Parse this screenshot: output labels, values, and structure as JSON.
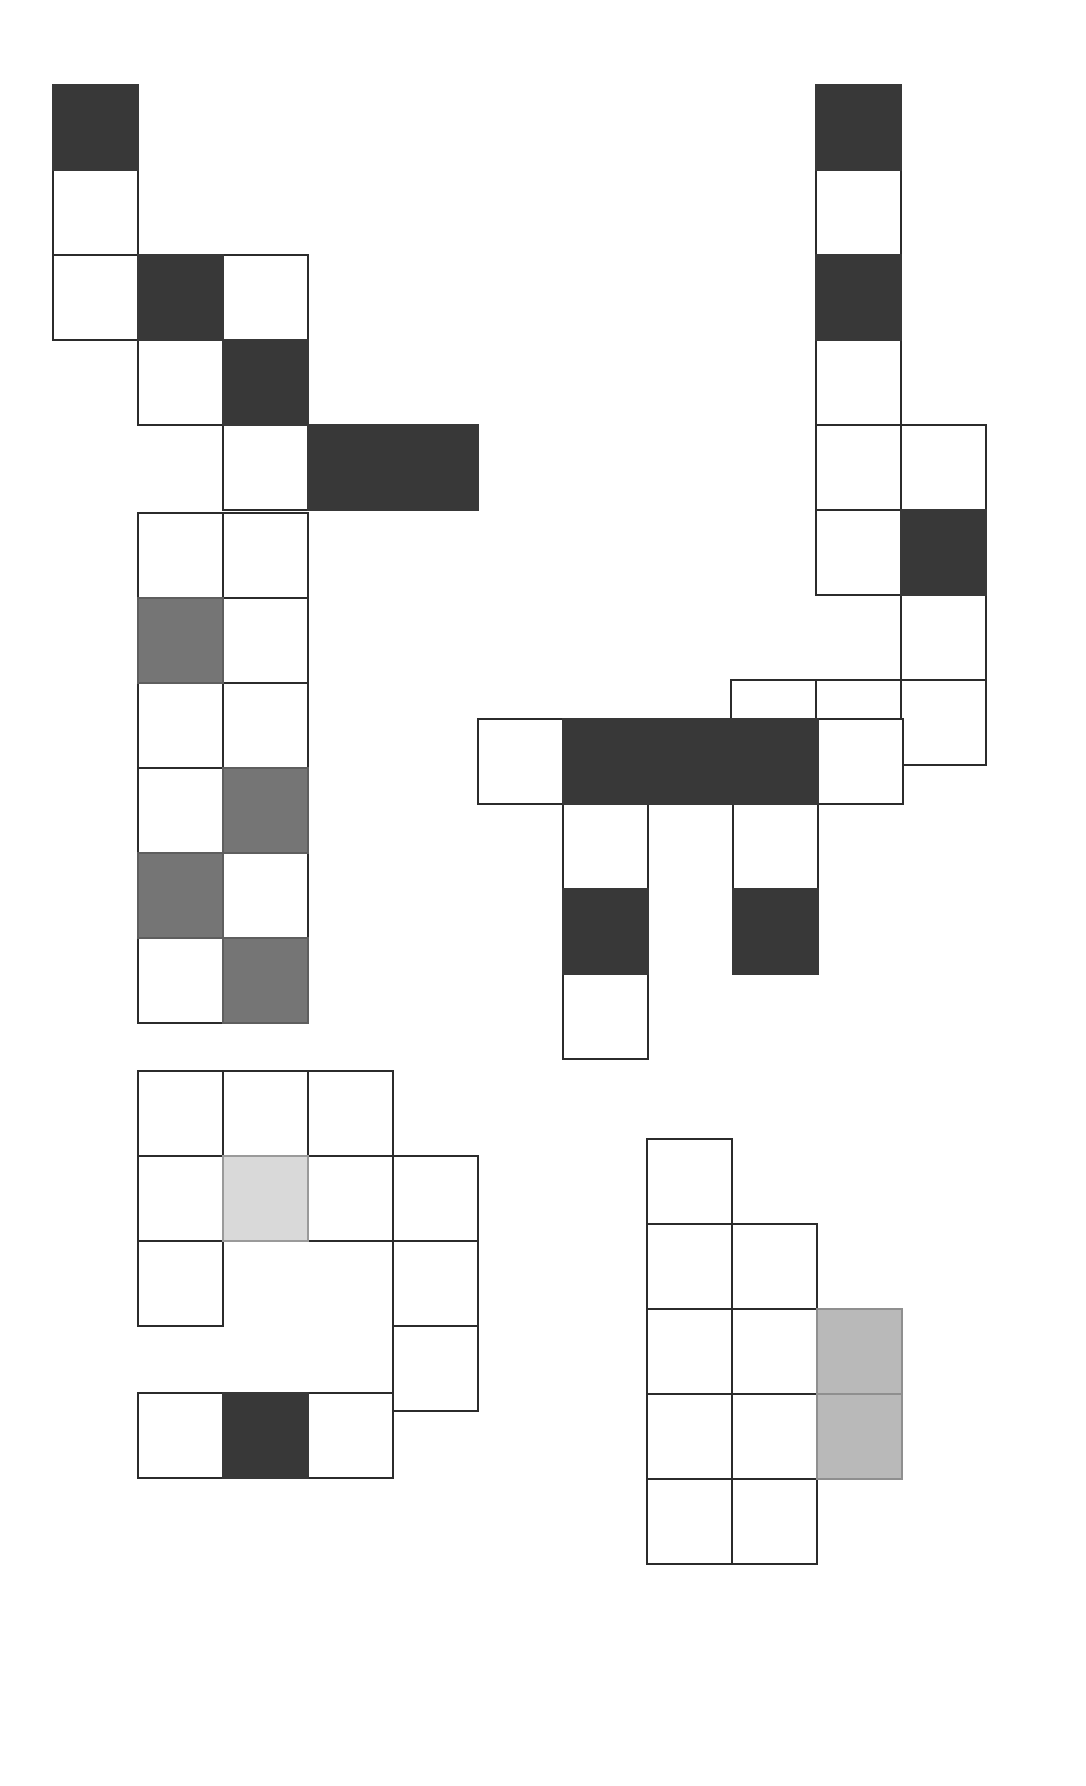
{
  "figure": {
    "background_color": "#ffffff",
    "stroke_color": "#2b2b2b",
    "cell_size": 85,
    "palette": {
      "none": "#ffffff",
      "dark": "#383838",
      "medium": "#757575",
      "light": "#b9b9b9",
      "pale": "#d9d9d9"
    },
    "shapes": [
      {
        "id": "shape-1",
        "name": "descending-staircase",
        "origin_x": 52,
        "origin_y": 84,
        "cell_size": 85,
        "cells": [
          {
            "col": 0,
            "row": 0,
            "fill": "dark"
          },
          {
            "col": 0,
            "row": 1,
            "fill": "none"
          },
          {
            "col": 0,
            "row": 2,
            "fill": "none"
          },
          {
            "col": 1,
            "row": 2,
            "fill": "dark"
          },
          {
            "col": 2,
            "row": 2,
            "fill": "none"
          },
          {
            "col": 1,
            "row": 3,
            "fill": "none"
          },
          {
            "col": 2,
            "row": 3,
            "fill": "dark"
          },
          {
            "col": 2,
            "row": 4,
            "fill": "none"
          },
          {
            "col": 3,
            "row": 4,
            "fill": "dark"
          },
          {
            "col": 4,
            "row": 4,
            "fill": "dark"
          }
        ]
      },
      {
        "id": "shape-2",
        "name": "vertical-column-with-foot",
        "origin_x": 730,
        "origin_y": 84,
        "cell_size": 85,
        "cells": [
          {
            "col": 1,
            "row": 0,
            "fill": "dark"
          },
          {
            "col": 1,
            "row": 1,
            "fill": "none"
          },
          {
            "col": 1,
            "row": 2,
            "fill": "dark"
          },
          {
            "col": 1,
            "row": 3,
            "fill": "none"
          },
          {
            "col": 1,
            "row": 4,
            "fill": "none"
          },
          {
            "col": 2,
            "row": 4,
            "fill": "none"
          },
          {
            "col": 1,
            "row": 5,
            "fill": "none"
          },
          {
            "col": 2,
            "row": 5,
            "fill": "dark"
          },
          {
            "col": 2,
            "row": 6,
            "fill": "none"
          },
          {
            "col": 0,
            "row": 7,
            "fill": "none"
          },
          {
            "col": 1,
            "row": 7,
            "fill": "none"
          },
          {
            "col": 2,
            "row": 7,
            "fill": "none"
          }
        ]
      },
      {
        "id": "shape-3",
        "name": "two-wide-checker-column",
        "origin_x": 137,
        "origin_y": 512,
        "cell_size": 85,
        "cells": [
          {
            "col": 0,
            "row": 0,
            "fill": "none"
          },
          {
            "col": 1,
            "row": 0,
            "fill": "none"
          },
          {
            "col": 0,
            "row": 1,
            "fill": "medium"
          },
          {
            "col": 1,
            "row": 1,
            "fill": "none"
          },
          {
            "col": 0,
            "row": 2,
            "fill": "none"
          },
          {
            "col": 1,
            "row": 2,
            "fill": "none"
          },
          {
            "col": 0,
            "row": 3,
            "fill": "none"
          },
          {
            "col": 1,
            "row": 3,
            "fill": "medium"
          },
          {
            "col": 0,
            "row": 4,
            "fill": "medium"
          },
          {
            "col": 1,
            "row": 4,
            "fill": "none"
          },
          {
            "col": 0,
            "row": 5,
            "fill": "none"
          },
          {
            "col": 1,
            "row": 5,
            "fill": "medium"
          }
        ]
      },
      {
        "id": "shape-4",
        "name": "table-with-legs",
        "origin_x": 477,
        "origin_y": 718,
        "cell_size": 85,
        "cells": [
          {
            "col": 0,
            "row": 0,
            "fill": "none"
          },
          {
            "col": 1,
            "row": 0,
            "fill": "dark"
          },
          {
            "col": 2,
            "row": 0,
            "fill": "dark"
          },
          {
            "col": 3,
            "row": 0,
            "fill": "dark"
          },
          {
            "col": 4,
            "row": 0,
            "fill": "none"
          },
          {
            "col": 1,
            "row": 1,
            "fill": "none"
          },
          {
            "col": 3,
            "row": 1,
            "fill": "none"
          },
          {
            "col": 1,
            "row": 2,
            "fill": "dark"
          },
          {
            "col": 3,
            "row": 2,
            "fill": "dark"
          },
          {
            "col": 1,
            "row": 3,
            "fill": "none"
          }
        ]
      },
      {
        "id": "shape-5",
        "name": "stepped-block-with-pale-center",
        "origin_x": 137,
        "origin_y": 1070,
        "cell_size": 85,
        "cells": [
          {
            "col": 0,
            "row": 0,
            "fill": "none"
          },
          {
            "col": 1,
            "row": 0,
            "fill": "none"
          },
          {
            "col": 2,
            "row": 0,
            "fill": "none"
          },
          {
            "col": 0,
            "row": 1,
            "fill": "none"
          },
          {
            "col": 1,
            "row": 1,
            "fill": "pale"
          },
          {
            "col": 2,
            "row": 1,
            "fill": "none"
          },
          {
            "col": 3,
            "row": 1,
            "fill": "none"
          },
          {
            "col": 0,
            "row": 2,
            "fill": "none"
          },
          {
            "col": 3,
            "row": 2,
            "fill": "none"
          },
          {
            "col": 3,
            "row": 3,
            "fill": "none"
          }
        ]
      },
      {
        "id": "shape-6",
        "name": "three-cell-bar-with-dark-middle",
        "origin_x": 137,
        "origin_y": 1392,
        "cell_size": 85,
        "cells": [
          {
            "col": 0,
            "row": 0,
            "fill": "none"
          },
          {
            "col": 1,
            "row": 0,
            "fill": "dark"
          },
          {
            "col": 2,
            "row": 0,
            "fill": "none"
          }
        ]
      },
      {
        "id": "shape-7",
        "name": "block-with-light-right-column",
        "origin_x": 646,
        "origin_y": 1138,
        "cell_size": 85,
        "cells": [
          {
            "col": 0,
            "row": 0,
            "fill": "none"
          },
          {
            "col": 0,
            "row": 1,
            "fill": "none"
          },
          {
            "col": 1,
            "row": 1,
            "fill": "none"
          },
          {
            "col": 0,
            "row": 2,
            "fill": "none"
          },
          {
            "col": 1,
            "row": 2,
            "fill": "none"
          },
          {
            "col": 2,
            "row": 2,
            "fill": "light"
          },
          {
            "col": 0,
            "row": 3,
            "fill": "none"
          },
          {
            "col": 1,
            "row": 3,
            "fill": "none"
          },
          {
            "col": 2,
            "row": 3,
            "fill": "light"
          },
          {
            "col": 0,
            "row": 4,
            "fill": "none"
          },
          {
            "col": 1,
            "row": 4,
            "fill": "none"
          }
        ]
      }
    ]
  }
}
